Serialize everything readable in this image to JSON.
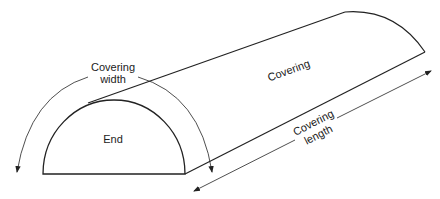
{
  "diagram": {
    "type": "half-cylinder covering",
    "labels": {
      "covering_width_line1": "Covering",
      "covering_width_line2": "width",
      "end": "End",
      "covering": "Covering",
      "covering_length_line1": "Covering",
      "covering_length_line2": "length"
    },
    "colors": {
      "stroke": "#222222",
      "background": "#ffffff"
    }
  }
}
